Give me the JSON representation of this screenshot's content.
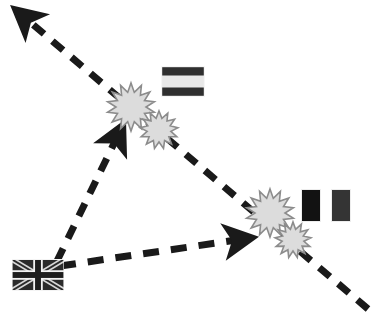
{
  "diagram": {
    "type": "geopolitical-conflict-map",
    "canvas": {
      "width": 382,
      "height": 321,
      "background": "#ffffff"
    },
    "palette": {
      "line": "#1a1a1a",
      "blast_fill": "#dcdcdc",
      "blast_stroke": "#8c8c8c",
      "flag_dark": "#2b2b2b",
      "flag_darker": "#111111",
      "flag_mid": "#3a3a3a",
      "flag_light": "#e2e2e2",
      "flag_border": "#f2f2f2"
    }
  },
  "flags": [
    {
      "id": "flag-uk",
      "name": "united-kingdom-flag",
      "label": "United Kingdom",
      "pattern": "union-jack",
      "x": 12,
      "y": 259,
      "width": 52,
      "height": 32,
      "colors": {
        "field": "#2b2b2b",
        "cross": "#f0f0f0",
        "saltire": "#d8d8d8"
      }
    },
    {
      "id": "flag-tricolor-horizontal",
      "name": "horizontal-tricolor-flag",
      "label": "Horizontal tricolour",
      "pattern": "horizontal-tricolor",
      "x": 161,
      "y": 66,
      "width": 44,
      "height": 31,
      "bands": [
        "#2f2f2f",
        "#e8e8e8",
        "#2f2f2f"
      ]
    },
    {
      "id": "flag-vertical-left",
      "name": "vertical-bicolor-flag-left-band",
      "label": "Vertical bicolour (left band)",
      "pattern": "solid-block",
      "x": 301,
      "y": 189,
      "width": 20,
      "height": 33,
      "colors": {
        "field": "#121212"
      }
    },
    {
      "id": "flag-vertical-right",
      "name": "vertical-bicolor-flag-right-band",
      "label": "Vertical bicolour (right band)",
      "pattern": "solid-block",
      "x": 331,
      "y": 189,
      "width": 20,
      "height": 33,
      "colors": {
        "field": "#343434"
      }
    }
  ],
  "arrows": [
    {
      "id": "arrow-northwest",
      "name": "attack-vector-northwest",
      "label": "Long dashed vector to upper-left",
      "from": {
        "x": 368,
        "y": 309
      },
      "to": {
        "x": 17,
        "y": 11
      },
      "dash": "14 11",
      "width": 7,
      "arrowhead": "to"
    },
    {
      "id": "arrow-up-from-flag",
      "name": "attack-vector-from-uk-north",
      "label": "Dashed vector from UK flag to upper blast",
      "from": {
        "x": 57,
        "y": 261
      },
      "to": {
        "x": 122,
        "y": 127
      },
      "dash": "14 11",
      "width": 7,
      "arrowhead": "to"
    },
    {
      "id": "arrow-east-from-flag",
      "name": "attack-vector-from-uk-east",
      "label": "Dashed vector from UK flag to lower blast",
      "from": {
        "x": 60,
        "y": 266
      },
      "to": {
        "x": 250,
        "y": 238
      },
      "dash": "16 12",
      "width": 7,
      "arrowhead": "to"
    }
  ],
  "blasts": [
    {
      "id": "blast-1",
      "name": "explosion-burst-upper-large",
      "cx": 131,
      "cy": 107,
      "r_outer": 24,
      "r_inner": 15,
      "points": 14
    },
    {
      "id": "blast-2",
      "name": "explosion-burst-upper-small",
      "cx": 159,
      "cy": 130,
      "r_outer": 19,
      "r_inner": 12,
      "points": 13
    },
    {
      "id": "blast-3",
      "name": "explosion-burst-lower-large",
      "cx": 270,
      "cy": 213,
      "r_outer": 24,
      "r_inner": 15,
      "points": 14
    },
    {
      "id": "blast-4",
      "name": "explosion-burst-lower-small",
      "cx": 293,
      "cy": 240,
      "r_outer": 18,
      "r_inner": 11,
      "points": 13
    }
  ],
  "legend": {
    "arrow_meaning": "attack / movement vector",
    "blast_meaning": "strike / impact point",
    "flag_meaning": "participating nation"
  }
}
